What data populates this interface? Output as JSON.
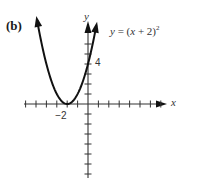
{
  "panel": {
    "label": "(b)"
  },
  "equation": {
    "lhs": "y",
    "eq": " = (",
    "x": "x",
    "rest": " + 2)",
    "exp": "2"
  },
  "axes": {
    "x_label": "x",
    "y_label": "y",
    "x_tick_label": "−2",
    "y_tick_label": "4"
  },
  "colors": {
    "curve": "#111111",
    "axis": "#333333",
    "background": "#ffffff"
  },
  "chart_data": {
    "type": "line",
    "panel_label": "(b)",
    "xlabel": "x",
    "ylabel": "y",
    "function": "y = (x + 2)^2",
    "vertex": [
      -2,
      0
    ],
    "series": [
      {
        "name": "y = (x + 2)^2",
        "x": [
          -4.9,
          -4.5,
          -4,
          -3.5,
          -3,
          -2.5,
          -2,
          -1.5,
          -1,
          -0.5,
          0,
          0.5,
          0.8
        ],
        "y": [
          8.41,
          6.25,
          4,
          2.25,
          1,
          0.25,
          0,
          0.25,
          1,
          2.25,
          4,
          6.25,
          7.84
        ]
      }
    ],
    "x_ticks": [
      -6,
      -5,
      -4,
      -3,
      -2,
      -1,
      0,
      1,
      2,
      3,
      4,
      5,
      6,
      7
    ],
    "y_ticks": [
      -7,
      -6,
      -5,
      -4,
      -3,
      -2,
      -1,
      0,
      1,
      2,
      3,
      4,
      5,
      6
    ],
    "labeled_ticks": {
      "x": [
        -2
      ],
      "y": [
        4
      ]
    },
    "xlim": [
      -6,
      7.5
    ],
    "ylim": [
      -7.5,
      8.5
    ],
    "grid": false,
    "legend": "none",
    "annotations": [
      "y = (x + 2)²"
    ]
  }
}
